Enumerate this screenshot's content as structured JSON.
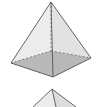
{
  "figure": {
    "pyramids": [
      {
        "name": "pyramid-1",
        "apex": [
          51,
          2
        ],
        "base": {
          "left": [
            11,
            63
          ],
          "front": [
            53,
            77
          ],
          "right": [
            91,
            58
          ],
          "back_hidden": [
            51,
            51
          ]
        },
        "base_fill": "#a9a9a9",
        "face_fill": "#e6e6e6",
        "edge_color": "#555555"
      },
      {
        "name": "pyramid-2-partial",
        "apex": [
          52,
          89
        ],
        "edges_to_bottom": [
          [
            33,
            107
          ],
          [
            56,
            107
          ],
          [
            76,
            107
          ]
        ],
        "face_fill": "#e3e3e3",
        "edge_color": "#555555"
      }
    ]
  }
}
